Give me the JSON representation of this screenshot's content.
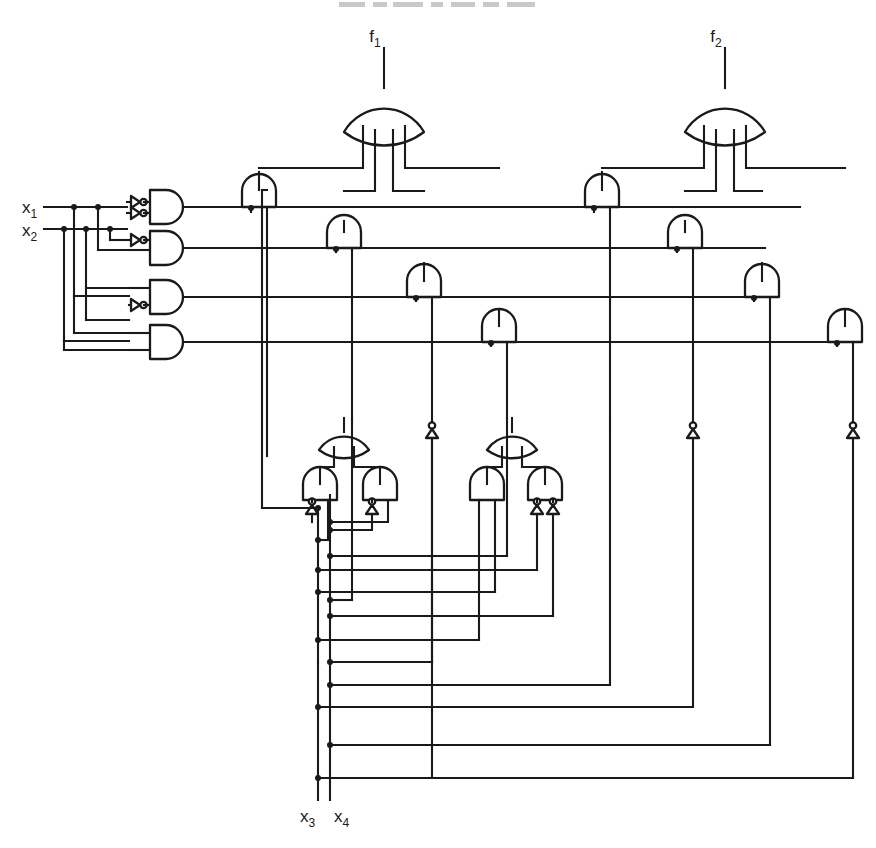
{
  "diagram": {
    "type": "logic-circuit-schematic",
    "line_color": "#1a1a1a",
    "background_color": "#ffffff"
  },
  "labels": {
    "f1": {
      "base": "f",
      "sub": "1"
    },
    "f2": {
      "base": "f",
      "sub": "2"
    },
    "x1": {
      "base": "x",
      "sub": "1"
    },
    "x2": {
      "base": "x",
      "sub": "2"
    },
    "x3": {
      "base": "x",
      "sub": "3"
    },
    "x4": {
      "base": "x",
      "sub": "4"
    }
  },
  "inputs": {
    "top_left": [
      {
        "name": "x1",
        "label": "x",
        "subscript": "1",
        "x": 22,
        "y": 203,
        "line_y": 207,
        "line_from": 44,
        "line_to": 158
      },
      {
        "name": "x2",
        "label": "x",
        "subscript": "2",
        "x": 22,
        "y": 226,
        "line_y": 229,
        "line_from": 44,
        "line_to": 158
      }
    ],
    "bottom": [
      {
        "name": "x3",
        "label": "x",
        "subscript": "3",
        "x": 305,
        "y": 816,
        "bus_x": 318,
        "bus_top": 508,
        "bus_bottom": 800
      },
      {
        "name": "x4",
        "label": "x",
        "subscript": "4",
        "x": 338,
        "y": 816,
        "bus_x": 330,
        "bus_top": 495,
        "bus_bottom": 800
      }
    ]
  },
  "decoder": {
    "description": "2-to-4 AND decoder on x1,x2 producing four minterm lines",
    "gates": [
      {
        "id": "dec1",
        "minterm": "x1'x2'",
        "body_x": 140,
        "y": 207,
        "inv_top": true,
        "inv_bottom": true,
        "out_line_y": 211,
        "out_to": 800
      },
      {
        "id": "dec2",
        "minterm": "x1'x2",
        "body_x": 140,
        "y": 248,
        "inv_top": true,
        "inv_bottom": false,
        "out_line_y": 253,
        "out_to": 765
      },
      {
        "id": "dec3",
        "minterm": "x1x2'",
        "body_x": 140,
        "y": 297,
        "inv_top": false,
        "inv_bottom": true,
        "out_line_y": 301,
        "out_to": 765
      },
      {
        "id": "dec4",
        "minterm": "x1x2",
        "body_x": 140,
        "y": 342,
        "inv_top": false,
        "inv_bottom": false,
        "out_line_y": 345,
        "out_to": 840
      }
    ]
  },
  "or_gates": [
    {
      "id": "or-f1",
      "output_label": "f1",
      "cx": 384,
      "top_y": 88,
      "inputs": 4,
      "stem_top": 48
    },
    {
      "id": "or-f2",
      "output_label": "f2",
      "cx": 725,
      "top_y": 88,
      "inputs": 4,
      "stem_top": 48
    }
  ],
  "and_gates_f1": [
    {
      "id": "a1",
      "cx": 259,
      "top_y": 172,
      "feeds": "or-f1",
      "decoder_line": "dec1"
    },
    {
      "id": "a2",
      "cx": 344,
      "top_y": 221,
      "feeds": "or-f1",
      "decoder_line": "dec2"
    },
    {
      "id": "a3",
      "cx": 424,
      "top_y": 263,
      "feeds": "or-f1",
      "decoder_line": "dec3"
    },
    {
      "id": "a4",
      "cx": 499,
      "top_y": 310,
      "feeds": "or-f1",
      "decoder_line": "dec4"
    }
  ],
  "and_gates_f2": [
    {
      "id": "b1",
      "cx": 602,
      "top_y": 172,
      "feeds": "or-f2",
      "decoder_line": "dec1"
    },
    {
      "id": "b2",
      "cx": 685,
      "top_y": 221,
      "feeds": "or-f2",
      "decoder_line": "dec2"
    },
    {
      "id": "b3",
      "cx": 762,
      "top_y": 263,
      "feeds": "or-f2",
      "decoder_line": "dec3"
    },
    {
      "id": "b4",
      "cx": 845,
      "top_y": 310,
      "feeds": "or-f2",
      "decoder_line": "dec4"
    }
  ],
  "sub_blocks": [
    {
      "id": "block-left",
      "description": "OR of two ANDs, left AND has inverted left input, right AND has inverted left input",
      "or": {
        "cx": 344,
        "top_y": 418
      },
      "and_left": {
        "cx": 320,
        "top_y": 463,
        "inv_left": true,
        "inv_right": false
      },
      "and_right": {
        "cx": 380,
        "top_y": 463,
        "inv_left": true,
        "inv_right": false
      }
    },
    {
      "id": "block-right",
      "description": "OR of two ANDs, left AND plain, right AND has both inputs inverted",
      "or": {
        "cx": 512,
        "top_y": 418
      },
      "and_left": {
        "cx": 487,
        "top_y": 463,
        "inv_left": false,
        "inv_right": false
      },
      "and_right": {
        "cx": 545,
        "top_y": 463,
        "inv_left": true,
        "inv_right": true
      }
    }
  ],
  "inline_inverters": [
    {
      "id": "inv-a",
      "x": 430,
      "y": 432
    },
    {
      "id": "inv-b",
      "x": 689,
      "y": 432
    },
    {
      "id": "inv-c",
      "x": 847,
      "y": 432
    }
  ],
  "counts": {
    "or_gates": 4,
    "and_gates": 16,
    "inverters": 11,
    "primary_inputs": 4,
    "outputs": 2
  }
}
